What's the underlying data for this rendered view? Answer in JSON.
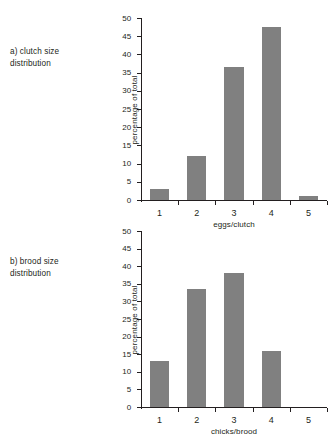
{
  "panels": [
    {
      "caption_line1": "a) clutch size",
      "caption_line2": "distribution",
      "chart_data": {
        "type": "bar",
        "title": "a) clutch size distribution",
        "categories": [
          "1",
          "2",
          "3",
          "4",
          "5"
        ],
        "values": [
          3,
          12,
          36.5,
          47.5,
          1
        ],
        "xlabel": "eggs/clutch",
        "ylabel": "percentage of total",
        "ylim": [
          0,
          50
        ],
        "yticks": [
          0,
          5,
          10,
          15,
          20,
          25,
          30,
          35,
          40,
          45,
          50
        ],
        "ytick_labels": [
          "0",
          "5",
          "10",
          "15",
          "20",
          "25",
          "30",
          "35",
          "40",
          "45",
          "50"
        ],
        "grid": false,
        "legend": "none",
        "bar_color": "#808080",
        "axis_color": "#231f20"
      }
    },
    {
      "caption_line1": "b) brood size",
      "caption_line2": "distribution",
      "chart_data": {
        "type": "bar",
        "title": "b) brood size distribution",
        "categories": [
          "1",
          "2",
          "3",
          "4",
          "5"
        ],
        "values": [
          13,
          33.5,
          38,
          16,
          0
        ],
        "xlabel": "chicks/brood",
        "ylabel": "percentage of total",
        "ylim": [
          0,
          50
        ],
        "yticks": [
          0,
          5,
          10,
          15,
          20,
          25,
          30,
          35,
          40,
          45,
          50
        ],
        "ytick_labels": [
          "0",
          "5",
          "10",
          "15",
          "20",
          "25",
          "30",
          "35",
          "40",
          "45",
          "50"
        ],
        "grid": false,
        "legend": "none",
        "bar_color": "#808080",
        "axis_color": "#231f20"
      }
    }
  ]
}
